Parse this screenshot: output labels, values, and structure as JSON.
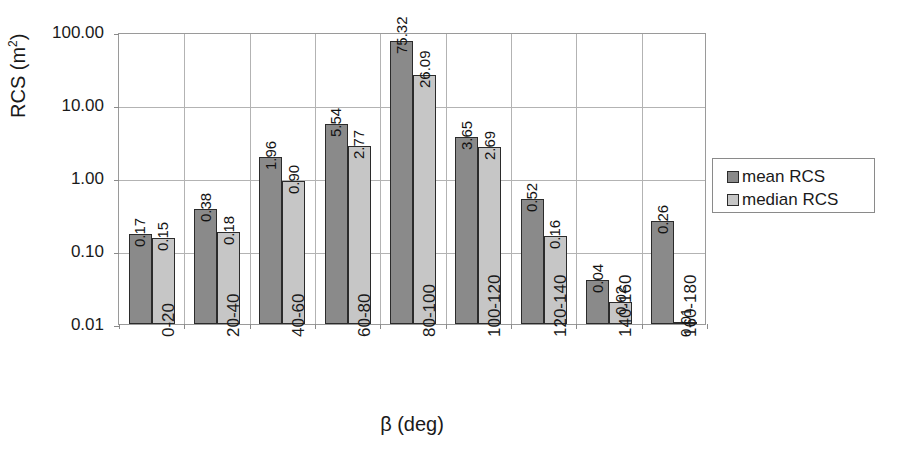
{
  "chart_data": {
    "type": "bar",
    "title": "",
    "xlabel": "β (deg)",
    "ylabel": "RCS (m²)",
    "ylabel_base": "RCS (m",
    "ylabel_exp": "2",
    "ylabel_tail": ")",
    "yscale": "log",
    "ylim": [
      0.01,
      100.0
    ],
    "ytick_labels": [
      "100.00",
      "10.00",
      "1.00",
      "0.10",
      "0.01"
    ],
    "ytick_values": [
      100.0,
      10.0,
      1.0,
      0.1,
      0.01
    ],
    "grid": "horizontal-and-vertical",
    "legend_position": "right-outside",
    "categories": [
      "0-20",
      "20-40",
      "40-60",
      "60-80",
      "80-100",
      "100-120",
      "120-140",
      "140-160",
      "160-180"
    ],
    "series": [
      {
        "name": "mean RCS",
        "color": "#8a8a8a",
        "values": [
          0.17,
          0.38,
          1.96,
          5.54,
          75.32,
          3.65,
          0.52,
          0.04,
          0.26
        ],
        "labels": [
          "0.17",
          "0.38",
          "1.96",
          "5.54",
          "75.32",
          "3.65",
          "0.52",
          "0.04",
          "0.26"
        ]
      },
      {
        "name": "median RCS",
        "color": "#c6c6c6",
        "values": [
          0.15,
          0.18,
          0.9,
          2.77,
          26.09,
          2.69,
          0.16,
          0.02,
          0.01
        ],
        "labels": [
          "0.15",
          "0.18",
          "0.90",
          "2.77",
          "26.09",
          "2.69",
          "0.16",
          "0.02",
          "0.01"
        ]
      }
    ]
  },
  "legend": {
    "items": [
      {
        "label": "mean RCS",
        "color": "#8a8a8a"
      },
      {
        "label": "median RCS",
        "color": "#c6c6c6"
      }
    ]
  }
}
